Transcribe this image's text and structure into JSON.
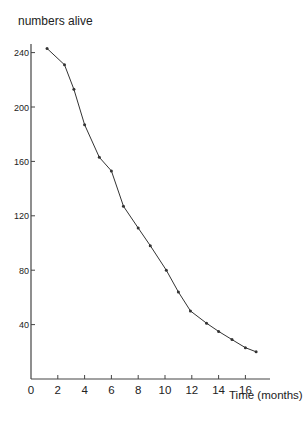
{
  "chart_data": {
    "type": "line",
    "title": "",
    "xlabel": "Time (months)",
    "ylabel": "numbers alive",
    "xlim": [
      0,
      18
    ],
    "ylim": [
      0,
      250
    ],
    "xticks": [
      0,
      2,
      4,
      6,
      8,
      10,
      12,
      14,
      16
    ],
    "yticks": [
      40,
      80,
      120,
      160,
      200,
      240
    ],
    "grid": false,
    "legend": null,
    "series": [
      {
        "name": "numbers alive",
        "x": [
          1.2,
          2.5,
          3.2,
          4.0,
          5.1,
          6.0,
          6.9,
          8.0,
          8.9,
          10.1,
          11.0,
          11.9,
          13.1,
          14.0,
          15.0,
          16.0,
          16.8
        ],
        "y": [
          243,
          231,
          213,
          187,
          163,
          153,
          127,
          111,
          98,
          80,
          64,
          50,
          41,
          35,
          29,
          23,
          20
        ]
      }
    ],
    "colors": {
      "line": "#333333",
      "axis": "#444444",
      "text": "#222222"
    }
  }
}
